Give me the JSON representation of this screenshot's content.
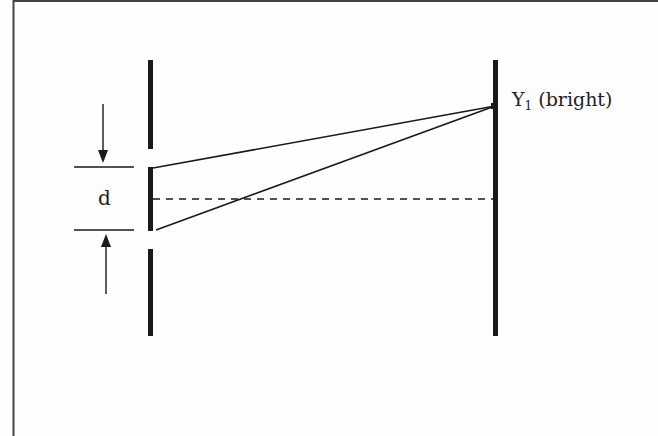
{
  "diagram": {
    "labels": {
      "slit_separation": "d",
      "fringe_symbol": "Y",
      "fringe_subscript": "1",
      "fringe_description": "(bright)"
    },
    "elements": {
      "barrier": {
        "x": 150,
        "segments": [
          [
            60,
            149
          ],
          [
            167,
            231
          ],
          [
            249,
            336
          ]
        ]
      },
      "screen": {
        "x": 495,
        "y_top": 60,
        "y_bottom": 336
      },
      "fringe_point": {
        "x": 495,
        "y": 106
      },
      "centerline_y": 199,
      "dimension_lines_y": [
        167,
        231
      ]
    },
    "colors": {
      "ink": "#1a1a1a",
      "background": "#fefefe",
      "frame": "#444444"
    }
  }
}
